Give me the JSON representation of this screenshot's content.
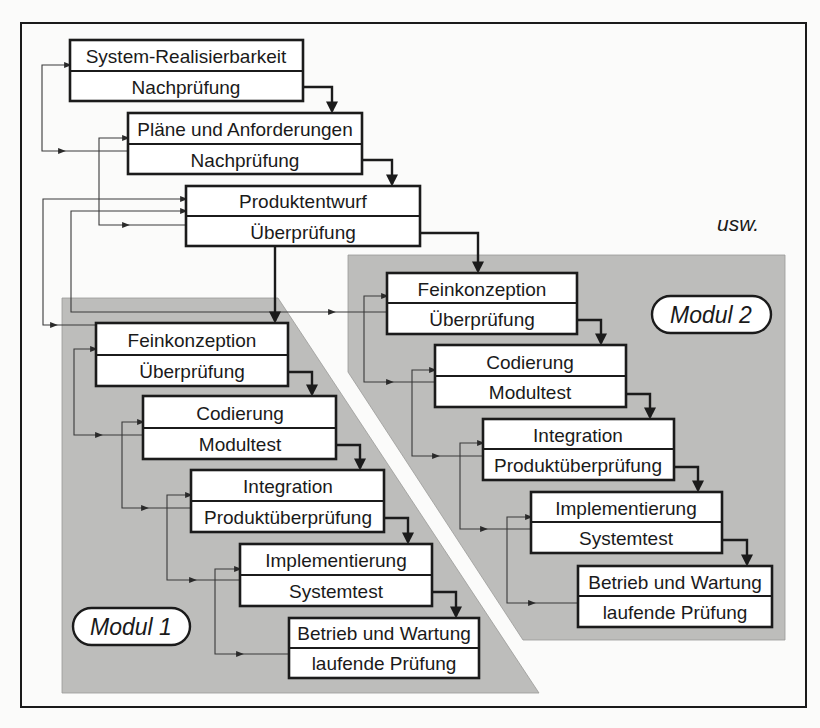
{
  "diagram": {
    "continuation_label": "usw.",
    "colors": {
      "module_background": "#bdbdbb",
      "box_fill": "#ffffff",
      "line": "#1b1b1b"
    },
    "top_phases": [
      {
        "activity": "System-Realisierbarkeit",
        "check": "Nachprüfung"
      },
      {
        "activity": "Pläne und Anforderungen",
        "check": "Nachprüfung"
      },
      {
        "activity": "Produktentwurf",
        "check": "Überprüfung"
      }
    ],
    "modules": [
      {
        "label": "Modul 1",
        "phases": [
          {
            "activity": "Feinkonzeption",
            "check": "Überprüfung"
          },
          {
            "activity": "Codierung",
            "check": "Modultest"
          },
          {
            "activity": "Integration",
            "check": "Produktüberprüfung"
          },
          {
            "activity": "Implementierung",
            "check": "Systemtest"
          },
          {
            "activity": "Betrieb und Wartung",
            "check": "laufende Prüfung"
          }
        ]
      },
      {
        "label": "Modul 2",
        "phases": [
          {
            "activity": "Feinkonzeption",
            "check": "Überprüfung"
          },
          {
            "activity": "Codierung",
            "check": "Modultest"
          },
          {
            "activity": "Integration",
            "check": "Produktüberprüfung"
          },
          {
            "activity": "Implementierung",
            "check": "Systemtest"
          },
          {
            "activity": "Betrieb und Wartung",
            "check": "laufende Prüfung"
          }
        ]
      }
    ]
  }
}
